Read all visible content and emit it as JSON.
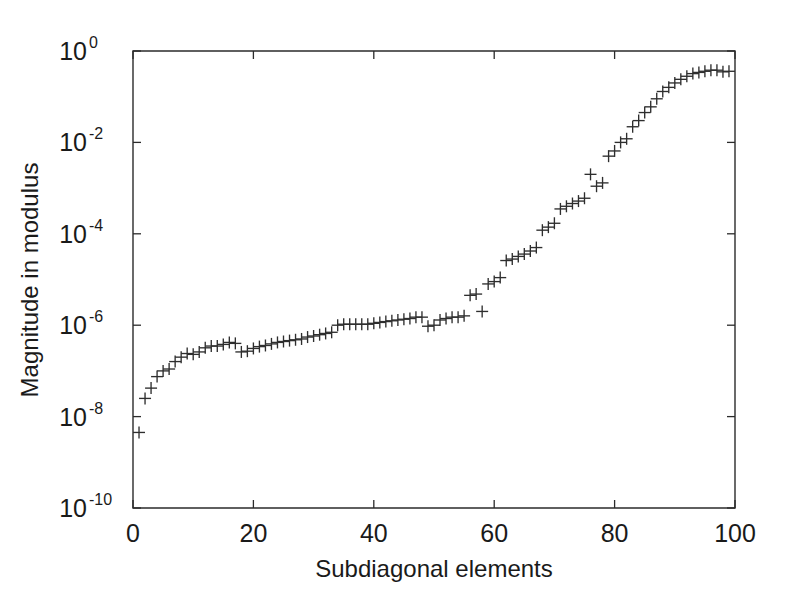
{
  "figure": {
    "background_color": "#ffffff",
    "axis_color": "#2b2b2b",
    "marker_color": "#2e2e2e",
    "marker_symbol": "+"
  },
  "chart_data": {
    "type": "scatter",
    "title": "",
    "xlabel": "Subdiagonal elements",
    "ylabel": "Magnitude in modulus",
    "xscale": "linear",
    "yscale": "log",
    "xlim": [
      0,
      100
    ],
    "ylim": [
      1e-10,
      1
    ],
    "grid": false,
    "legend": null,
    "xticks": [
      0,
      20,
      40,
      60,
      80,
      100
    ],
    "xtick_labels": [
      "0",
      "20",
      "40",
      "60",
      "80",
      "100"
    ],
    "yticks": [
      1,
      0.01,
      0.0001,
      1e-06,
      1e-08,
      1e-10
    ],
    "ytick_labels": [
      "10^0",
      "10^-2",
      "10^-4",
      "10^-6",
      "10^-8",
      "10^-10"
    ],
    "ytick_mantissa": "10",
    "ytick_exponents": [
      "0",
      "-2",
      "-4",
      "-6",
      "-8",
      "-10"
    ],
    "marker": "+",
    "series": [
      {
        "name": "subdiagonal magnitude",
        "x": [
          1,
          2,
          3,
          4,
          5,
          6,
          7,
          8,
          9,
          10,
          11,
          12,
          13,
          14,
          15,
          16,
          17,
          18,
          19,
          20,
          21,
          22,
          23,
          24,
          25,
          26,
          27,
          28,
          29,
          30,
          31,
          32,
          33,
          34,
          35,
          36,
          37,
          38,
          39,
          40,
          41,
          42,
          43,
          44,
          45,
          46,
          47,
          48,
          49,
          50,
          51,
          52,
          53,
          54,
          55,
          56,
          57,
          58,
          59,
          60,
          61,
          62,
          63,
          64,
          65,
          66,
          67,
          68,
          69,
          70,
          71,
          72,
          73,
          74,
          75,
          76,
          77,
          78,
          79,
          80,
          81,
          82,
          83,
          84,
          85,
          86,
          87,
          88,
          89,
          90,
          91,
          92,
          93,
          94,
          95,
          96,
          97,
          98,
          99
        ],
        "y": [
          4.5e-09,
          2.5e-08,
          4.2e-08,
          7.5e-08,
          1e-07,
          1.1e-07,
          1.6e-07,
          2e-07,
          2.4e-07,
          2.3e-07,
          2.6e-07,
          3.2e-07,
          3.5e-07,
          3.5e-07,
          3.8e-07,
          4.2e-07,
          4e-07,
          2.6e-07,
          2.7e-07,
          3.1e-07,
          3.4e-07,
          3.6e-07,
          3.9e-07,
          4.2e-07,
          4.4e-07,
          4.6e-07,
          4.8e-07,
          5e-07,
          5.5e-07,
          5.8e-07,
          6.2e-07,
          6.6e-07,
          7e-07,
          1e-06,
          1.05e-06,
          1.05e-06,
          1.05e-06,
          1.05e-06,
          1.05e-06,
          1.1e-06,
          1.15e-06,
          1.2e-06,
          1.25e-06,
          1.3e-06,
          1.35e-06,
          1.4e-06,
          1.5e-06,
          1.5e-06,
          9.5e-07,
          1e-06,
          1.3e-06,
          1.4e-06,
          1.5e-06,
          1.5e-06,
          1.6e-06,
          4.5e-06,
          4.8e-06,
          2e-06,
          8e-06,
          9e-06,
          1.1e-05,
          2.6e-05,
          2.8e-05,
          3.2e-05,
          3.6e-05,
          4.2e-05,
          5e-05,
          0.00012,
          0.00014,
          0.00017,
          0.00035,
          0.0004,
          0.00046,
          0.00052,
          0.0006,
          0.002,
          0.0011,
          0.0013,
          0.005,
          0.0065,
          0.01,
          0.012,
          0.022,
          0.03,
          0.045,
          0.06,
          0.09,
          0.13,
          0.16,
          0.2,
          0.24,
          0.28,
          0.32,
          0.34,
          0.36,
          0.38,
          0.38,
          0.35,
          0.36
        ]
      }
    ]
  }
}
